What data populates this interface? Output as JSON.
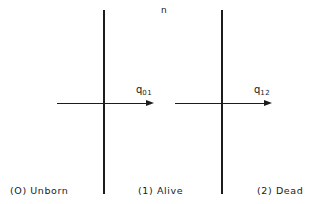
{
  "diagram": {
    "top_label": "n",
    "states": [
      {
        "id": "0",
        "label": "(O) Unborn"
      },
      {
        "id": "1",
        "label": "(1) Alive"
      },
      {
        "id": "2",
        "label": "(2) Dead"
      }
    ],
    "transitions": [
      {
        "from": "0",
        "to": "1",
        "symbol": "q",
        "subscript": "01"
      },
      {
        "from": "1",
        "to": "2",
        "symbol": "q",
        "subscript": "12"
      }
    ]
  }
}
